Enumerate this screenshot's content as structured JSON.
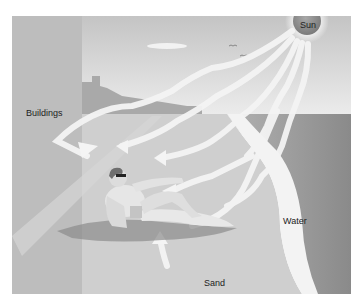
{
  "diagram": {
    "type": "illustration",
    "labels": {
      "sun": "Sun",
      "buildings": "Buildings",
      "water": "Water",
      "sand": "Sand"
    },
    "colors": {
      "sky": "#d8d8d8",
      "building": "#bdbdbd",
      "sand": "#c9c9c9",
      "water": "#8e8e8e",
      "shore_foam": "#f2f2f2",
      "sun": "#8a8a8a",
      "rays": "#f4f4f4"
    }
  }
}
